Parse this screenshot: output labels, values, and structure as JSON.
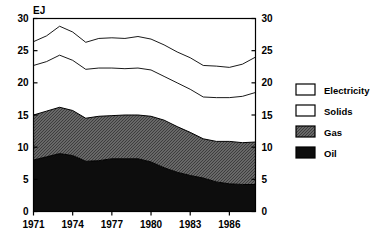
{
  "unit_label": "EJ",
  "legend": {
    "items": [
      {
        "label": "Electricity",
        "swatch": "white"
      },
      {
        "label": "Solids",
        "swatch": "white"
      },
      {
        "label": "Gas",
        "swatch": "gray-hatch"
      },
      {
        "label": "Oil",
        "swatch": "black"
      }
    ]
  },
  "axes": {
    "y_left_ticks": [
      "0",
      "5",
      "10",
      "15",
      "20",
      "25",
      "30"
    ],
    "y_right_ticks": [
      "0",
      "5",
      "10",
      "15",
      "20",
      "25",
      "30"
    ],
    "x_ticks": [
      "1971",
      "1974",
      "1977",
      "1980",
      "1983",
      "1986"
    ]
  },
  "colors": {
    "oil": "#0d0d0d",
    "gas": "#6e6e6e",
    "solids": "#ffffff",
    "electricity": "#ffffff",
    "axis": "#000000",
    "background": "#ffffff"
  },
  "chart_data": {
    "type": "area",
    "title": "",
    "subtitle": "",
    "xlabel": "",
    "ylabel": "EJ",
    "ylim": [
      0,
      30
    ],
    "ytick_step": 5,
    "grid": false,
    "stacked": true,
    "legend_position": "right",
    "x": [
      1971,
      1972,
      1973,
      1974,
      1975,
      1976,
      1977,
      1978,
      1979,
      1980,
      1981,
      1982,
      1983,
      1984,
      1985,
      1986,
      1987,
      1988
    ],
    "xtick_labels": [
      "1971",
      "1974",
      "1977",
      "1980",
      "1983",
      "1986"
    ],
    "xtick_values": [
      1971,
      1974,
      1977,
      1980,
      1983,
      1986
    ],
    "series": [
      {
        "name": "Oil",
        "values": [
          8.0,
          8.5,
          9.0,
          8.7,
          7.8,
          7.9,
          8.2,
          8.2,
          8.2,
          7.7,
          6.8,
          6.1,
          5.6,
          5.2,
          4.6,
          4.3,
          4.2,
          4.2
        ]
      },
      {
        "name": "Gas",
        "values": [
          7.0,
          7.1,
          7.2,
          7.0,
          6.7,
          6.9,
          6.7,
          6.8,
          6.8,
          7.1,
          7.4,
          7.1,
          6.7,
          6.1,
          6.3,
          6.6,
          6.5,
          6.6
        ]
      },
      {
        "name": "Solids",
        "values": [
          7.7,
          7.7,
          8.1,
          7.8,
          7.6,
          7.5,
          7.4,
          7.2,
          7.3,
          7.2,
          6.8,
          6.8,
          6.7,
          6.5,
          6.8,
          6.8,
          7.2,
          7.7
        ]
      },
      {
        "name": "Electricity",
        "values": [
          3.7,
          4.0,
          4.5,
          4.4,
          4.2,
          4.6,
          4.7,
          4.7,
          4.9,
          4.8,
          4.9,
          4.8,
          4.9,
          4.9,
          4.9,
          4.7,
          5.0,
          5.5
        ]
      }
    ],
    "cumulative": {
      "oil": [
        8.0,
        8.5,
        9.0,
        8.7,
        7.8,
        7.9,
        8.2,
        8.2,
        8.2,
        7.7,
        6.8,
        6.1,
        5.6,
        5.2,
        4.6,
        4.3,
        4.2,
        4.2
      ],
      "oil_gas": [
        15.0,
        15.6,
        16.2,
        15.7,
        14.5,
        14.8,
        14.9,
        15.0,
        15.0,
        14.8,
        14.2,
        13.2,
        12.3,
        11.3,
        10.9,
        10.9,
        10.7,
        10.8
      ],
      "oil_gas_sol": [
        22.7,
        23.3,
        24.3,
        23.5,
        22.1,
        22.3,
        22.3,
        22.2,
        22.3,
        22.0,
        21.0,
        20.0,
        19.0,
        17.8,
        17.7,
        17.7,
        17.9,
        18.5
      ],
      "total": [
        26.4,
        27.3,
        28.8,
        27.9,
        26.3,
        26.9,
        27.0,
        26.9,
        27.2,
        26.8,
        25.9,
        24.8,
        23.9,
        22.7,
        22.6,
        22.4,
        22.9,
        24.0
      ]
    }
  }
}
